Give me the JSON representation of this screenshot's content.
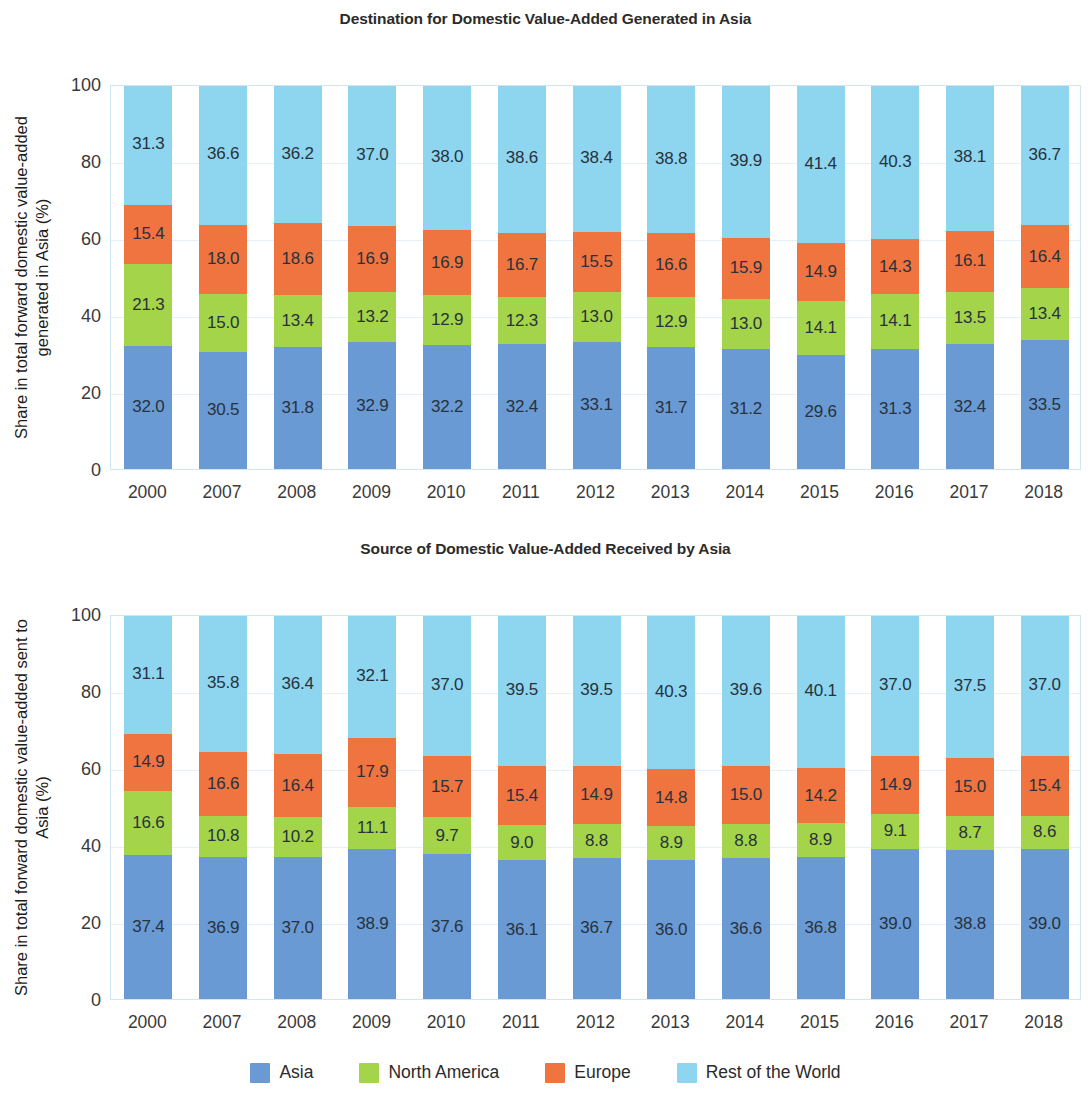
{
  "colors": {
    "asia": "#6a9ad4",
    "north_america": "#a4d449",
    "europe": "#f07440",
    "rest_of_world": "#8ed6f0",
    "grid": "#e3f1fa",
    "plot_border": "#cfe7f5",
    "text": "#2b2b2b"
  },
  "legend": {
    "items": [
      {
        "label": "Asia",
        "color_key": "asia"
      },
      {
        "label": "North America",
        "color_key": "north_america"
      },
      {
        "label": "Europe",
        "color_key": "europe"
      },
      {
        "label": "Rest of the World",
        "color_key": "rest_of_world"
      }
    ]
  },
  "chart_data": [
    {
      "type": "bar",
      "stacked": true,
      "title": "Destination for Domestic Value-Added Generated in Asia",
      "xlabel": "",
      "ylabel": "Share in total forward domestic value-added generated in Asia (%)",
      "ylim": [
        0,
        100
      ],
      "yticks": [
        0,
        20,
        40,
        60,
        80,
        100
      ],
      "ytick_labels": [
        "0",
        "20",
        "40",
        "60",
        "80",
        "100"
      ],
      "grid": true,
      "legend_position": "bottom",
      "categories": [
        "2000",
        "2007",
        "2008",
        "2009",
        "2010",
        "2011",
        "2012",
        "2013",
        "2014",
        "2015",
        "2016",
        "2017",
        "2018"
      ],
      "series": [
        {
          "name": "Asia",
          "color_key": "asia",
          "values": [
            32.0,
            30.5,
            31.8,
            32.9,
            32.2,
            32.4,
            33.1,
            31.7,
            31.2,
            29.6,
            31.3,
            32.4,
            33.5
          ]
        },
        {
          "name": "North America",
          "color_key": "north_america",
          "values": [
            21.3,
            15.0,
            13.4,
            13.2,
            12.9,
            12.3,
            13.0,
            12.9,
            13.0,
            14.1,
            14.1,
            13.5,
            13.4
          ]
        },
        {
          "name": "Europe",
          "color_key": "europe",
          "values": [
            15.4,
            18.0,
            18.6,
            16.9,
            16.9,
            16.7,
            15.5,
            16.6,
            15.9,
            14.9,
            14.3,
            16.1,
            16.4
          ]
        },
        {
          "name": "Rest of the World",
          "color_key": "rest_of_world",
          "values": [
            31.3,
            36.6,
            36.2,
            37.0,
            38.0,
            38.6,
            38.4,
            38.8,
            39.9,
            41.4,
            40.3,
            38.1,
            36.7
          ]
        }
      ]
    },
    {
      "type": "bar",
      "stacked": true,
      "title": "Source of Domestic Value-Added Received by Asia",
      "xlabel": "",
      "ylabel": "Share in total forward domestic value-added sent to Asia (%)",
      "ylim": [
        0,
        100
      ],
      "yticks": [
        0,
        20,
        40,
        60,
        80,
        100
      ],
      "ytick_labels": [
        "0",
        "20",
        "40",
        "60",
        "80",
        "100"
      ],
      "grid": true,
      "legend_position": "bottom",
      "categories": [
        "2000",
        "2007",
        "2008",
        "2009",
        "2010",
        "2011",
        "2012",
        "2013",
        "2014",
        "2015",
        "2016",
        "2017",
        "2018"
      ],
      "series": [
        {
          "name": "Asia",
          "color_key": "asia",
          "values": [
            37.4,
            36.9,
            37.0,
            38.9,
            37.6,
            36.1,
            36.7,
            36.0,
            36.6,
            36.8,
            39.0,
            38.8,
            39.0
          ]
        },
        {
          "name": "North America",
          "color_key": "north_america",
          "values": [
            16.6,
            10.8,
            10.2,
            11.1,
            9.7,
            9.0,
            8.8,
            8.9,
            8.8,
            8.9,
            9.1,
            8.7,
            8.6
          ]
        },
        {
          "name": "Europe",
          "color_key": "europe",
          "values": [
            14.9,
            16.6,
            16.4,
            17.9,
            15.7,
            15.4,
            14.9,
            14.8,
            15.0,
            14.2,
            14.9,
            15.0,
            15.4
          ]
        },
        {
          "name": "Rest of the World",
          "color_key": "rest_of_world",
          "values": [
            31.1,
            35.8,
            36.4,
            32.1,
            37.0,
            39.5,
            39.5,
            40.3,
            39.6,
            40.1,
            37.0,
            37.5,
            37.0
          ]
        }
      ]
    }
  ]
}
